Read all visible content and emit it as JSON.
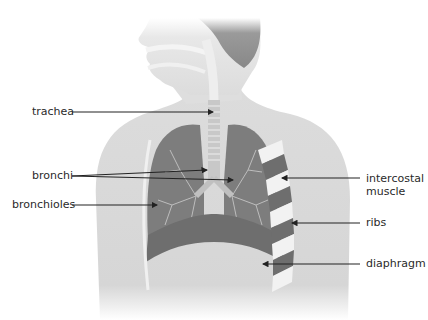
{
  "diagram": {
    "labels": {
      "trachea": "trachea",
      "bronchi": "bronchi",
      "bronchioles": "bronchioles",
      "intercostal_line1": "intercostal",
      "intercostal_line2": "muscle",
      "ribs": "ribs",
      "diaphragm": "diaphragm"
    },
    "colors": {
      "background": "#ffffff",
      "body": "#d9d9d9",
      "head": "#e6e6e6",
      "lung": "#7d7d7d",
      "rib_white": "#f2f2f2",
      "muscle": "#6e6e6e",
      "airway": "#c8c8c8",
      "arrow": "#222222",
      "text": "#2a2a2a"
    }
  }
}
